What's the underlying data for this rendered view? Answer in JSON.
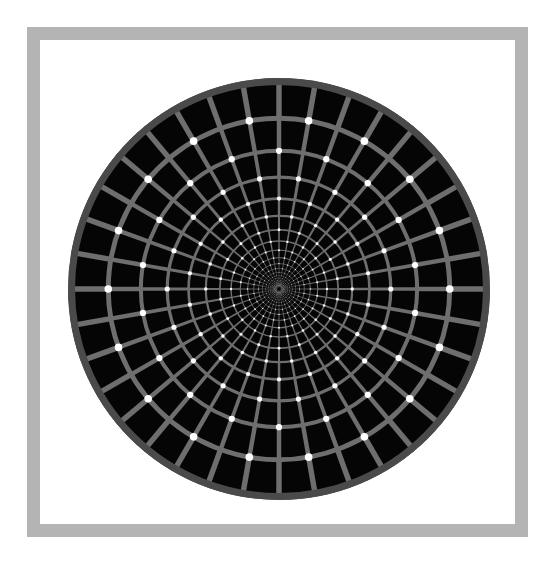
{
  "figure": {
    "name": "rotating-snakes-polar-grid-illusion",
    "kind": "optical-illusion-figure",
    "canvas": {
      "width": 559,
      "height": 574,
      "background": "#ffffff"
    },
    "frame": {
      "name": "gray-square-border",
      "x": 27,
      "y": 27,
      "width": 501,
      "height": 510,
      "stroke_width": 13,
      "color": "#b4b4b4",
      "fill": "none"
    },
    "disc": {
      "name": "polar-grid-disc",
      "center_x": 279,
      "center_y": 289,
      "radius": 211,
      "cell_color": "#050505",
      "line_color": "#6e6e6e",
      "outer_rim_color": "#4a4a4a",
      "dot_color": "#ffffff",
      "spokes": 36,
      "rings": 22,
      "ring_growth": 1.175,
      "inner_radius": 2.0,
      "line_width_outer": 6.0,
      "line_width_min": 0.35,
      "dot_radius_outer": 4.6,
      "dot_radius_min": 0.25,
      "dot_ring_start": 3,
      "dot_ring_end": 21,
      "dot_parity_offset": 0,
      "rim_width": 7
    }
  },
  "chart_data": {
    "type": "scatter",
    "title": "",
    "xlabel": "",
    "ylabel": "",
    "coordinate_system": "polar",
    "center": [
      279,
      289
    ],
    "radius_px": 211,
    "spoke_count": 36,
    "spoke_angle_step_deg": 10,
    "ring_count": 22,
    "ring_growth_factor": 1.175,
    "grid": true,
    "legend": "none",
    "series": [
      {
        "name": "radial-spokes",
        "values": [
          0,
          10,
          20,
          30,
          40,
          50,
          60,
          70,
          80,
          90,
          100,
          110,
          120,
          130,
          140,
          150,
          160,
          170,
          180,
          190,
          200,
          210,
          220,
          230,
          240,
          250,
          260,
          270,
          280,
          290,
          300,
          310,
          320,
          330,
          340,
          350
        ]
      },
      {
        "name": "ring-radii-px",
        "values": [
          2.0,
          2.4,
          2.8,
          3.2,
          3.8,
          4.5,
          5.3,
          6.2,
          7.3,
          8.5,
          10.0,
          11.8,
          13.8,
          16.3,
          19.1,
          22.5,
          26.4,
          31.0,
          36.5,
          42.8,
          50.3,
          59.1,
          69.5,
          81.6,
          95.9,
          112.7,
          132.4,
          155.6,
          182.8,
          211.0
        ]
      }
    ]
  }
}
